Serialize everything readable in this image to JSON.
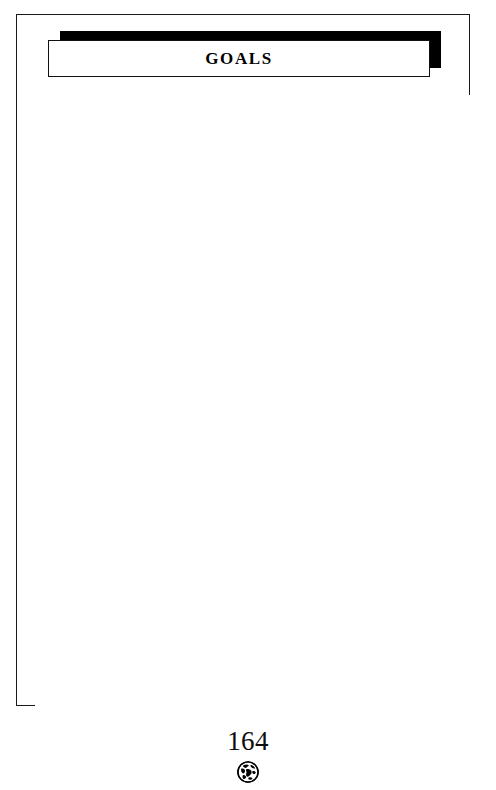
{
  "document": {
    "type": "printed-worksheet-page",
    "section_title": "GOALS",
    "body_text": "",
    "page_number": "164",
    "footer_icon": "globe-icon",
    "colors": {
      "ink": "#000000",
      "border": "#1a1a1a",
      "paper": "#ffffff",
      "banner_shadow": "#000000"
    }
  },
  "header": {
    "title": "GOALS"
  },
  "body": {
    "content": "",
    "note": ""
  },
  "footer": {
    "page_number": "164",
    "icon_name": "globe-icon"
  }
}
